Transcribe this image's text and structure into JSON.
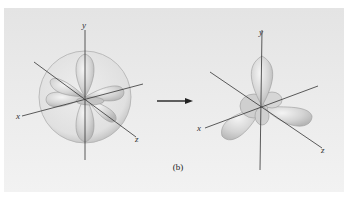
{
  "figure": {
    "caption": "(b)",
    "left_diagram": {
      "description": "d-orbital lobes inside transparent sphere",
      "axes": {
        "x": "x",
        "y": "y",
        "z": "z"
      }
    },
    "arrow": {
      "direction": "right"
    },
    "right_diagram": {
      "description": "three-lobed orbital shape",
      "axes": {
        "x": "x",
        "y": "y",
        "z": "z"
      }
    },
    "colors": {
      "background": "#e8e8e8",
      "lobe_fill": "#d6d6d6",
      "lobe_stroke": "#9a9a9a",
      "axis": "#333333"
    }
  }
}
